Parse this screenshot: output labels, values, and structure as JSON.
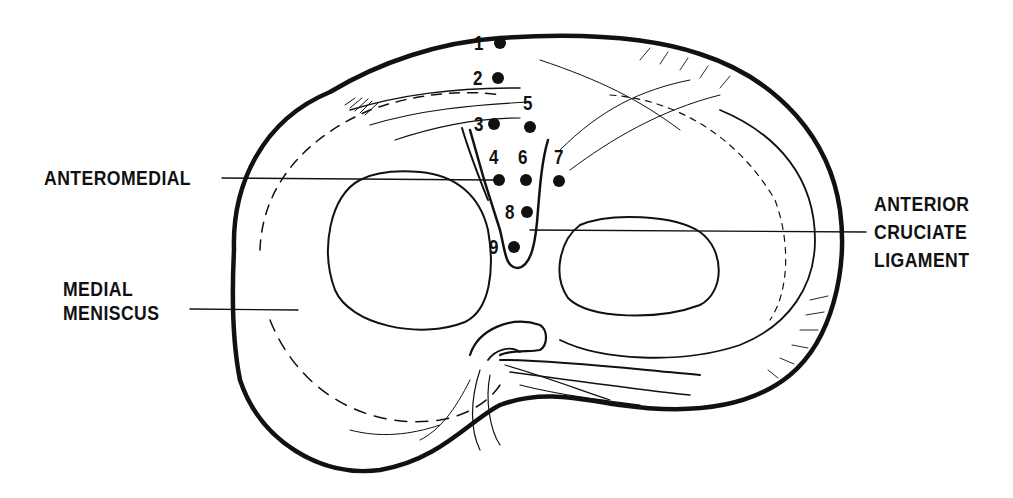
{
  "figure": {
    "labels": {
      "anteromedial": "ANTEROMEDIAL",
      "medial_meniscus_line1": "MEDIAL",
      "medial_meniscus_line2": "MENISCUS",
      "acl_line1": "ANTERIOR",
      "acl_line2": "CRUCIATE",
      "acl_line3": "LIGAMENT"
    },
    "points": [
      {
        "n": "1",
        "x": 500,
        "y": 43
      },
      {
        "n": "2",
        "x": 498,
        "y": 78
      },
      {
        "n": "3",
        "x": 494,
        "y": 124
      },
      {
        "n": "4",
        "x": 499,
        "y": 180
      },
      {
        "n": "5",
        "x": 530,
        "y": 127
      },
      {
        "n": "6",
        "x": 526,
        "y": 180
      },
      {
        "n": "7",
        "x": 559,
        "y": 181
      },
      {
        "n": "8",
        "x": 527,
        "y": 212
      },
      {
        "n": "9",
        "x": 514,
        "y": 247
      }
    ],
    "colors": {
      "ink": "#111111",
      "background": "#ffffff"
    }
  }
}
